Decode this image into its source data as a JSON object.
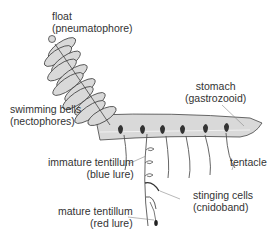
{
  "diagram": {
    "colors": {
      "body_fill": "#d9d9d9",
      "outline": "#444444",
      "dark_parts": "#333333",
      "leader": "#888888",
      "text": "#333333"
    },
    "labels": {
      "float": {
        "line1": "float",
        "line2": "(pneumatophore)"
      },
      "swimming_bells": {
        "line1": "swimming bells",
        "line2": "(nectophores)"
      },
      "stomach": {
        "line1": "stomach",
        "line2": "(gastrozooid)"
      },
      "tentacle": {
        "line1": "tentacle"
      },
      "immature_tentillum": {
        "line1": "immature tentillum",
        "line2": "(blue lure)"
      },
      "stinging_cells": {
        "line1": "stinging cells",
        "line2": "(cnidoband)"
      },
      "mature_tentillum": {
        "line1": "mature tentillum",
        "line2": "(red lure)"
      }
    }
  }
}
